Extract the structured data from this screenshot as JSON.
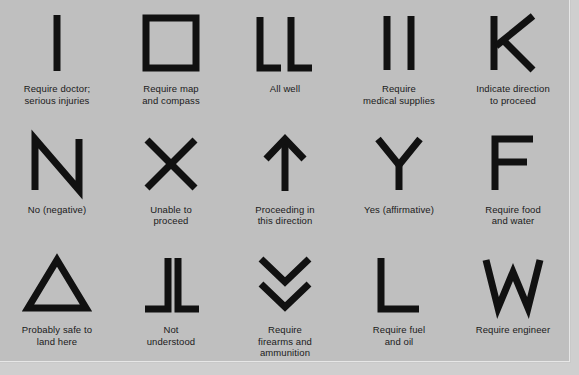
{
  "chart": {
    "type": "table",
    "background_color": "#bfbfbf",
    "stroke_color": "#111111",
    "caption_color": "#1a1a1a",
    "columns": 5,
    "rows": 3,
    "signals": [
      {
        "id": "require-doctor",
        "symbol": "I",
        "shape": "vertical-bar",
        "caption_lines": [
          "Require doctor;",
          "serious injuries"
        ]
      },
      {
        "id": "require-map-and-compass",
        "symbol": "□",
        "shape": "open-square",
        "caption_lines": [
          "Require map",
          "and compass"
        ]
      },
      {
        "id": "all-well",
        "symbol": "LL",
        "shape": "double-L",
        "caption_lines": [
          "All well"
        ]
      },
      {
        "id": "require-medical-supplies",
        "symbol": "II",
        "shape": "double-vertical-bar",
        "caption_lines": [
          "Require",
          "medical supplies"
        ]
      },
      {
        "id": "indicate-direction-to-proceed",
        "symbol": "K",
        "shape": "letter-K",
        "caption_lines": [
          "Indicate direction",
          "to proceed"
        ]
      },
      {
        "id": "no-negative",
        "symbol": "N",
        "shape": "letter-N",
        "caption_lines": [
          "No (negative)"
        ]
      },
      {
        "id": "unable-to-proceed",
        "symbol": "X",
        "shape": "letter-X",
        "caption_lines": [
          "Unable to",
          "proceed"
        ]
      },
      {
        "id": "proceeding-in-this-direction",
        "symbol": "↑",
        "shape": "up-arrow",
        "caption_lines": [
          "Proceeding in",
          "this direction"
        ]
      },
      {
        "id": "yes-affirmative",
        "symbol": "Y",
        "shape": "letter-Y",
        "caption_lines": [
          "Yes (affirmative)"
        ]
      },
      {
        "id": "require-food-and-water",
        "symbol": "F",
        "shape": "letter-F",
        "caption_lines": [
          "Require food",
          "and water"
        ]
      },
      {
        "id": "probably-safe-to-land-here",
        "symbol": "△",
        "shape": "open-triangle",
        "caption_lines": [
          "Probably safe to",
          "land here"
        ]
      },
      {
        "id": "not-understood",
        "symbol": "⅃L",
        "shape": "mirrored-L-and-L",
        "caption_lines": [
          "Not",
          "understood"
        ]
      },
      {
        "id": "require-firearms-and-ammunition",
        "symbol": "∨∨",
        "shape": "double-chevron-down",
        "caption_lines": [
          "Require",
          "firearms and",
          "ammunition"
        ]
      },
      {
        "id": "require-fuel-and-oil",
        "symbol": "L",
        "shape": "letter-L",
        "caption_lines": [
          "Require fuel",
          "and oil"
        ]
      },
      {
        "id": "require-engineer",
        "symbol": "W",
        "shape": "letter-W",
        "caption_lines": [
          "Require engineer"
        ]
      }
    ]
  }
}
